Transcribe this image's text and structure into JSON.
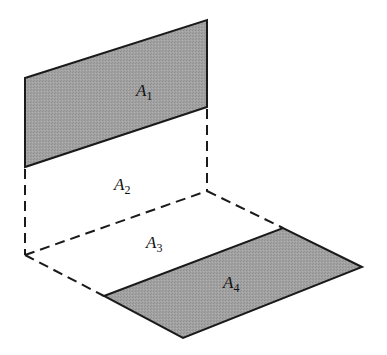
{
  "diagram": {
    "colors": {
      "shaded_fill": "#9e9e9e",
      "stroke": "#1a1a1a",
      "background": "#ffffff"
    },
    "regions": [
      {
        "id": "A1",
        "letter": "A",
        "sub": "1",
        "shaded": true,
        "points": "25,78 207,20 207,107 25,167",
        "label_pos": [
          136,
          82
        ]
      },
      {
        "id": "A2",
        "letter": "A",
        "sub": "2",
        "shaded": false,
        "label_pos": [
          114,
          176
        ]
      },
      {
        "id": "A3",
        "letter": "A",
        "sub": "3",
        "shaded": false,
        "label_pos": [
          146,
          234
        ]
      },
      {
        "id": "A4",
        "letter": "A",
        "sub": "4",
        "shaded": true,
        "points": "104,296 283,228 362,267 183,338",
        "label_pos": [
          223,
          274
        ]
      }
    ],
    "dashed_lines": [
      {
        "x1": 25,
        "y1": 167,
        "x2": 25,
        "y2": 255
      },
      {
        "x1": 207,
        "y1": 107,
        "x2": 207,
        "y2": 191
      },
      {
        "x1": 25,
        "y1": 255,
        "x2": 207,
        "y2": 191
      },
      {
        "x1": 25,
        "y1": 255,
        "x2": 104,
        "y2": 296
      },
      {
        "x1": 207,
        "y1": 191,
        "x2": 283,
        "y2": 228
      }
    ]
  },
  "labels": {
    "a1_letter": "A",
    "a1_sub": "1",
    "a2_letter": "A",
    "a2_sub": "2",
    "a3_letter": "A",
    "a3_sub": "3",
    "a4_letter": "A",
    "a4_sub": "4"
  }
}
